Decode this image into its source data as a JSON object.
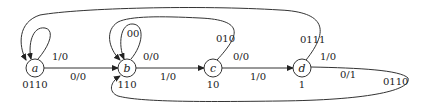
{
  "diagram": {
    "type": "state-machine",
    "nodes": [
      {
        "id": "a",
        "label": "a",
        "output_code": "0110"
      },
      {
        "id": "b",
        "label": "b",
        "output_code": "110"
      },
      {
        "id": "c",
        "label": "c",
        "output_code": "10"
      },
      {
        "id": "d",
        "label": "d",
        "output_code": "1"
      }
    ],
    "edges": [
      {
        "from": "a",
        "to": "a",
        "label": "1/0"
      },
      {
        "from": "a",
        "to": "b",
        "label": "0/0"
      },
      {
        "from": "b",
        "to": "b",
        "label": "0/0",
        "code": "00"
      },
      {
        "from": "b",
        "to": "c",
        "label": "1/0"
      },
      {
        "from": "c",
        "to": "b",
        "label": "0/0",
        "code": "010"
      },
      {
        "from": "c",
        "to": "d",
        "label": "1/0"
      },
      {
        "from": "d",
        "to": "a",
        "label": "1/0",
        "code": "0111"
      },
      {
        "from": "d",
        "to": "b",
        "label": "0/1",
        "code": "0110"
      }
    ]
  }
}
